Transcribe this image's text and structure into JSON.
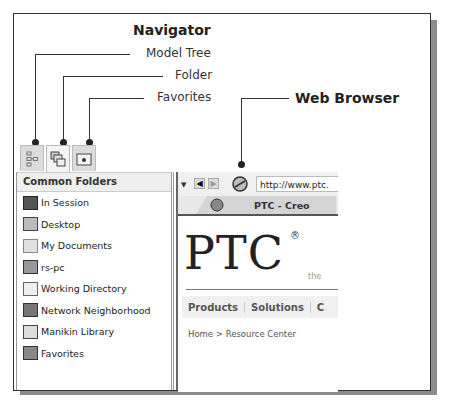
{
  "callouts": {
    "navigator": "Navigator",
    "model_tree": "Model Tree",
    "folder": "Folder",
    "favorites": "Favorites",
    "web_browser": "Web Browser"
  },
  "navigator": {
    "tabs": [
      {
        "name": "model-tree-tab",
        "icon": "model-tree-icon"
      },
      {
        "name": "folder-tab",
        "icon": "folder-browser-icon",
        "active": true
      },
      {
        "name": "favorites-tab",
        "icon": "favorites-icon"
      }
    ],
    "header": "Common Folders",
    "folders": [
      {
        "label": "In Session",
        "icon": "monitor-icon"
      },
      {
        "label": "Desktop",
        "icon": "desktop-icon"
      },
      {
        "label": "My Documents",
        "icon": "documents-icon"
      },
      {
        "label": "rs-pc",
        "icon": "computer-icon"
      },
      {
        "label": "Working Directory",
        "icon": "working-directory-icon"
      },
      {
        "label": "Network Neighborhood",
        "icon": "network-icon"
      },
      {
        "label": "Manikin Library",
        "icon": "library-icon"
      },
      {
        "label": "Favorites",
        "icon": "favorites-folder-icon"
      }
    ]
  },
  "browser": {
    "url": "http://www.ptc.",
    "tab_title": "PTC - Creo",
    "logo": "PTC",
    "logo_mark": "®",
    "tagline": "the",
    "nav_items": [
      "Products",
      "Solutions",
      "C"
    ],
    "breadcrumb": "Home > Resource Center"
  }
}
